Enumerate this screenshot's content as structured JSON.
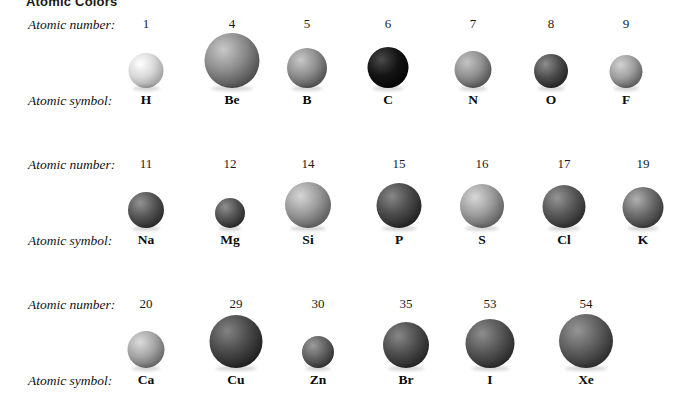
{
  "figure": {
    "title": "Atomic Colors",
    "row_labels": {
      "number": "Atomic number:",
      "symbol": "Atomic symbol:"
    },
    "rows": [
      {
        "id": "row-1",
        "cells": [
          {
            "number": "1",
            "symbol": "H",
            "cx": 146,
            "size": 35,
            "base": "#d8d8d8",
            "hi": "#ffffff",
            "shadow": "#8d8d8d"
          },
          {
            "number": "4",
            "symbol": "Be",
            "cx": 232,
            "size": 55,
            "base": "#8a8a8a",
            "hi": "#c9c9c9",
            "shadow": "#3a3a3a"
          },
          {
            "number": "5",
            "symbol": "B",
            "cx": 307,
            "size": 40,
            "base": "#8e8e8e",
            "hi": "#c8c8c8",
            "shadow": "#3d3d3d"
          },
          {
            "number": "6",
            "symbol": "C",
            "cx": 388,
            "size": 41,
            "base": "#141414",
            "hi": "#4a4a4a",
            "shadow": "#000000"
          },
          {
            "number": "7",
            "symbol": "N",
            "cx": 473,
            "size": 37,
            "base": "#909090",
            "hi": "#c4c4c4",
            "shadow": "#3f3f3f"
          },
          {
            "number": "8",
            "symbol": "O",
            "cx": 551,
            "size": 34,
            "base": "#4d4d4d",
            "hi": "#8d8d8d",
            "shadow": "#171717"
          },
          {
            "number": "9",
            "symbol": "F",
            "cx": 626,
            "size": 33,
            "base": "#9e9e9e",
            "hi": "#d2d2d2",
            "shadow": "#4a4a4a"
          }
        ]
      },
      {
        "id": "row-2",
        "cells": [
          {
            "number": "11",
            "symbol": "Na",
            "cx": 146,
            "size": 36,
            "base": "#555555",
            "hi": "#939393",
            "shadow": "#1c1c1c"
          },
          {
            "number": "12",
            "symbol": "Mg",
            "cx": 230,
            "size": 30,
            "base": "#535353",
            "hi": "#8f8f8f",
            "shadow": "#1b1b1b"
          },
          {
            "number": "14",
            "symbol": "Si",
            "cx": 308,
            "size": 46,
            "base": "#9a9a9a",
            "hi": "#d6d6d6",
            "shadow": "#4a4a4a"
          },
          {
            "number": "15",
            "symbol": "P",
            "cx": 399,
            "size": 45,
            "base": "#4b4b4b",
            "hi": "#878787",
            "shadow": "#151515"
          },
          {
            "number": "16",
            "symbol": "S",
            "cx": 482,
            "size": 44,
            "base": "#9c9c9c",
            "hi": "#d8d8d8",
            "shadow": "#4c4c4c"
          },
          {
            "number": "17",
            "symbol": "Cl",
            "cx": 564,
            "size": 43,
            "base": "#585858",
            "hi": "#949494",
            "shadow": "#1e1e1e"
          },
          {
            "number": "19",
            "symbol": "K",
            "cx": 643,
            "size": 41,
            "base": "#6b6b6b",
            "hi": "#b0b0b0",
            "shadow": "#272727"
          }
        ]
      },
      {
        "id": "row-3",
        "cells": [
          {
            "number": "20",
            "symbol": "Ca",
            "cx": 146,
            "size": 37,
            "base": "#a5a5a5",
            "hi": "#dcdcdc",
            "shadow": "#535353"
          },
          {
            "number": "29",
            "symbol": "Cu",
            "cx": 236,
            "size": 53,
            "base": "#4a4a4a",
            "hi": "#828282",
            "shadow": "#121212"
          },
          {
            "number": "30",
            "symbol": "Zn",
            "cx": 318,
            "size": 32,
            "base": "#626262",
            "hi": "#9c9c9c",
            "shadow": "#232323"
          },
          {
            "number": "35",
            "symbol": "Br",
            "cx": 406,
            "size": 46,
            "base": "#4e4e4e",
            "hi": "#878787",
            "shadow": "#161616"
          },
          {
            "number": "53",
            "symbol": "I",
            "cx": 490,
            "size": 49,
            "base": "#565656",
            "hi": "#8d8d8d",
            "shadow": "#1a1a1a"
          },
          {
            "number": "54",
            "symbol": "Xe",
            "cx": 586,
            "size": 54,
            "base": "#5e5e5e",
            "hi": "#969696",
            "shadow": "#1e1e1e"
          }
        ]
      }
    ]
  }
}
